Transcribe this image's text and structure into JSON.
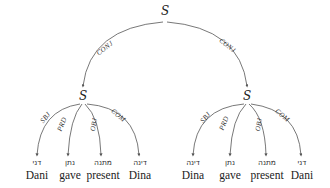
{
  "diagram": {
    "root": {
      "label": "S"
    },
    "root_edges": [
      {
        "label": "CONJ",
        "target": "left"
      },
      {
        "label": "CONJ",
        "target": "right"
      }
    ],
    "left": {
      "label": "S",
      "edges": [
        {
          "label": "SBJ",
          "hebrew": "דני",
          "english": "Dani"
        },
        {
          "label": "PRD",
          "hebrew": "נתן",
          "english": "gave"
        },
        {
          "label": "OBJ",
          "hebrew": "מתנה",
          "english": "present"
        },
        {
          "label": "COM",
          "hebrew": "דינה",
          "english": "Dina"
        }
      ]
    },
    "right": {
      "label": "S",
      "edges": [
        {
          "label": "SBJ",
          "hebrew": "דינה",
          "english": "Dina"
        },
        {
          "label": "PRD",
          "hebrew": "נתן",
          "english": "gave"
        },
        {
          "label": "OBJ",
          "hebrew": "מתנה",
          "english": "present"
        },
        {
          "label": "COM",
          "hebrew": "דני",
          "english": "Dani"
        }
      ]
    }
  }
}
